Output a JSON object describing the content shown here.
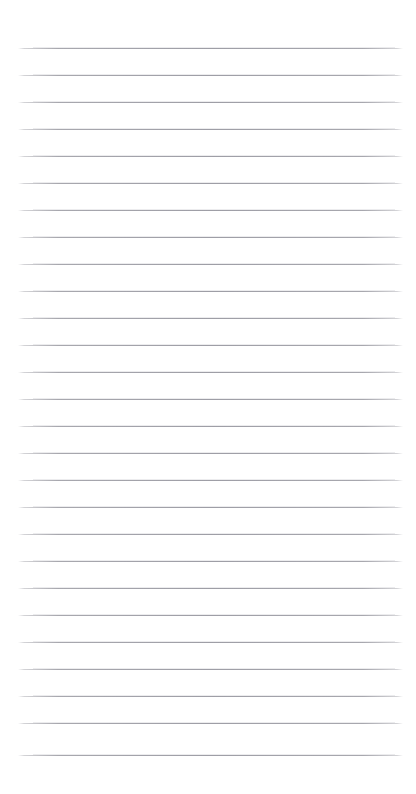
{
  "document": {
    "kind": "ruled-notebook-paper",
    "title": "Blank lined paper",
    "body_text": "",
    "page_width": 416,
    "page_height": 794,
    "background_color": "#ffffff"
  },
  "ruling": {
    "line_count": 27,
    "line_color": "#a3a3aa",
    "line_thickness_px": 1,
    "line_spacing_px": 27,
    "first_line_y": 48,
    "last_line_y": 755,
    "line_start_x": 18,
    "line_end_x": 403,
    "margin_rule_visible": false,
    "lines_y": [
      48,
      75,
      102,
      129,
      156,
      183,
      210,
      237,
      264,
      291,
      318,
      345,
      372,
      399,
      426,
      453,
      480,
      507,
      534,
      561,
      588,
      615,
      642,
      669,
      696,
      723,
      755
    ]
  },
  "margins": {
    "top_px": 48,
    "bottom_px": 39,
    "left_px": 18,
    "right_px": 13
  }
}
